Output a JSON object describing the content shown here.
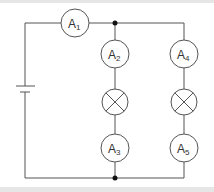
{
  "diagram": {
    "type": "circuit",
    "colors": {
      "wire": "#555555",
      "background": "#ffffff",
      "band": "#e6e6e6"
    },
    "components": [
      {
        "id": "A1",
        "kind": "ammeter",
        "letter": "A",
        "subscript": "1"
      },
      {
        "id": "A2",
        "kind": "ammeter",
        "letter": "A",
        "subscript": "2"
      },
      {
        "id": "A3",
        "kind": "ammeter",
        "letter": "A",
        "subscript": "3"
      },
      {
        "id": "A4",
        "kind": "ammeter",
        "letter": "A",
        "subscript": "4"
      },
      {
        "id": "A5",
        "kind": "ammeter",
        "letter": "A",
        "subscript": "5"
      },
      {
        "id": "lamp-left",
        "kind": "lamp"
      },
      {
        "id": "lamp-right",
        "kind": "lamp"
      },
      {
        "id": "cell",
        "kind": "battery"
      }
    ],
    "labels": {
      "a1": {
        "letter": "A",
        "sub": "1"
      },
      "a2": {
        "letter": "A",
        "sub": "2"
      },
      "a3": {
        "letter": "A",
        "sub": "3"
      },
      "a4": {
        "letter": "A",
        "sub": "4"
      },
      "a5": {
        "letter": "A",
        "sub": "5"
      }
    }
  }
}
